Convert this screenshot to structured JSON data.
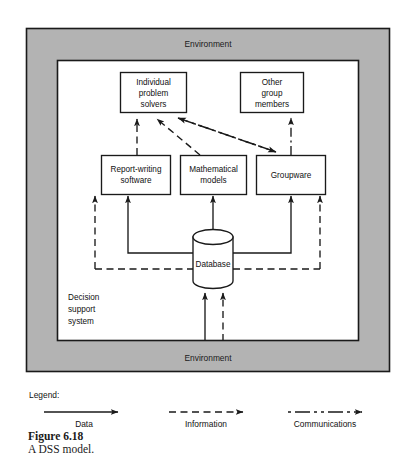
{
  "figure": {
    "caption_label": "Figure 6.18",
    "caption_title": "A DSS model."
  },
  "diagram": {
    "environment_top_label": "Environment",
    "environment_bottom_label": "Environment",
    "system_label_line1": "Decision",
    "system_label_line2": "support",
    "system_label_line3": "system",
    "nodes": [
      {
        "id": "individual-problem-solvers",
        "lines": [
          "Individual",
          "problem",
          "solvers"
        ],
        "shape": "rect"
      },
      {
        "id": "other-group-members",
        "lines": [
          "Other",
          "group",
          "members"
        ],
        "shape": "rect"
      },
      {
        "id": "report-writing-software",
        "lines": [
          "Report-writing",
          "software"
        ],
        "shape": "rect"
      },
      {
        "id": "mathematical-models",
        "lines": [
          "Mathematical",
          "models"
        ],
        "shape": "rect"
      },
      {
        "id": "groupware",
        "lines": [
          "Groupware"
        ],
        "shape": "rect"
      },
      {
        "id": "database",
        "lines": [
          "Database"
        ],
        "shape": "cylinder"
      }
    ],
    "colors": {
      "environment_fill": "#b3b3b3",
      "system_fill": "#ffffff",
      "stroke": "#1a1a1a",
      "text": "#111111"
    }
  },
  "legend": {
    "title": "Legend:",
    "items": [
      {
        "id": "data",
        "label": "Data",
        "line_style": "solid"
      },
      {
        "id": "information",
        "label": "Information",
        "line_style": "dashed"
      },
      {
        "id": "communications",
        "label": "Communications",
        "line_style": "dash-dot"
      }
    ]
  }
}
